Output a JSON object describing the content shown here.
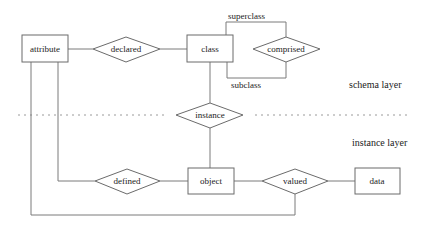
{
  "diagram": {
    "type": "entity-relationship",
    "layers": {
      "schema": "schema layer",
      "instance": "instance layer"
    },
    "entities": {
      "attribute": "attribute",
      "class": "class",
      "object": "object",
      "data": "data"
    },
    "relationships": {
      "declared": "declared",
      "comprised": "comprised",
      "instance": "instance",
      "defined": "defined",
      "valued": "valued"
    },
    "edge_labels": {
      "superclass": "superclass",
      "subclass": "subclass"
    },
    "colors": {
      "stroke": "#6b6b6b",
      "separator": "#9a9a9a",
      "text": "#222222",
      "background": "#ffffff"
    }
  }
}
